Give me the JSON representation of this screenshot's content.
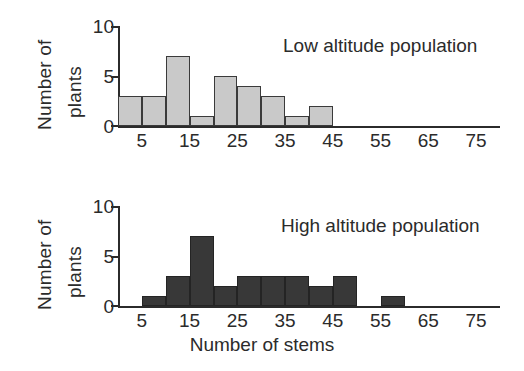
{
  "chart_data": [
    {
      "type": "bar",
      "title": "Low altitude population",
      "xlabel": "",
      "ylabel": "Number of plants",
      "ylabel_lines": [
        "Number of",
        "plants"
      ],
      "xlim": [
        0,
        80
      ],
      "ylim": [
        0,
        10
      ],
      "ytick_labels": [
        "10",
        "5",
        "0"
      ],
      "ytick_values": [
        10,
        5,
        0
      ],
      "xtick_labels": [
        "5",
        "15",
        "25",
        "35",
        "45",
        "55",
        "65",
        "75"
      ],
      "xtick_values": [
        5,
        15,
        25,
        35,
        45,
        55,
        65,
        75
      ],
      "bin_width": 10,
      "bin_starts": [
        0,
        10,
        20,
        30,
        40,
        50,
        60,
        70
      ],
      "grid": false,
      "legend": "none",
      "bar_fill": "#c9c9c9",
      "bar_edge": "#3a3a3a",
      "bars": [
        {
          "x_start": 0,
          "x_end": 5,
          "value": 3
        },
        {
          "x_start": 5,
          "x_end": 10,
          "value": 3
        },
        {
          "x_start": 10,
          "x_end": 15,
          "value": 7
        },
        {
          "x_start": 15,
          "x_end": 20,
          "value": 1
        },
        {
          "x_start": 20,
          "x_end": 25,
          "value": 5
        },
        {
          "x_start": 25,
          "x_end": 30,
          "value": 4
        },
        {
          "x_start": 30,
          "x_end": 35,
          "value": 3
        },
        {
          "x_start": 35,
          "x_end": 40,
          "value": 1
        },
        {
          "x_start": 40,
          "x_end": 45,
          "value": 2
        },
        {
          "x_start": 45,
          "x_end": 50,
          "value": 0
        },
        {
          "x_start": 50,
          "x_end": 55,
          "value": 0
        },
        {
          "x_start": 55,
          "x_end": 60,
          "value": 0
        },
        {
          "x_start": 60,
          "x_end": 65,
          "value": 0
        },
        {
          "x_start": 65,
          "x_end": 70,
          "value": 0
        },
        {
          "x_start": 70,
          "x_end": 75,
          "value": 0
        },
        {
          "x_start": 75,
          "x_end": 80,
          "value": 0
        }
      ],
      "categories": [
        2.5,
        7.5,
        12.5,
        17.5,
        22.5,
        27.5,
        32.5,
        37.5,
        42.5,
        47.5,
        52.5,
        57.5,
        62.5,
        67.5,
        72.5,
        77.5
      ],
      "values": [
        3,
        3,
        7,
        1,
        5,
        4,
        3,
        1,
        2,
        0,
        0,
        0,
        0,
        0,
        0,
        0
      ]
    },
    {
      "type": "bar",
      "title": "High altitude population",
      "xlabel": "Number of stems",
      "ylabel": "Number of plants",
      "ylabel_lines": [
        "Number of",
        "plants"
      ],
      "xlim": [
        0,
        80
      ],
      "ylim": [
        0,
        10
      ],
      "ytick_labels": [
        "10",
        "5",
        "0"
      ],
      "ytick_values": [
        10,
        5,
        0
      ],
      "xtick_labels": [
        "5",
        "15",
        "25",
        "35",
        "45",
        "55",
        "65",
        "75"
      ],
      "xtick_values": [
        5,
        15,
        25,
        35,
        45,
        55,
        65,
        75
      ],
      "bin_width": 10,
      "bin_starts": [
        0,
        10,
        20,
        30,
        40,
        50,
        60,
        70
      ],
      "grid": false,
      "legend": "none",
      "bar_fill": "#383838",
      "bar_edge": "#242424",
      "bars": [
        {
          "x_start": 0,
          "x_end": 5,
          "value": 0
        },
        {
          "x_start": 5,
          "x_end": 10,
          "value": 1
        },
        {
          "x_start": 10,
          "x_end": 15,
          "value": 3
        },
        {
          "x_start": 15,
          "x_end": 20,
          "value": 7
        },
        {
          "x_start": 20,
          "x_end": 25,
          "value": 2
        },
        {
          "x_start": 25,
          "x_end": 30,
          "value": 3
        },
        {
          "x_start": 30,
          "x_end": 35,
          "value": 3
        },
        {
          "x_start": 35,
          "x_end": 40,
          "value": 3
        },
        {
          "x_start": 40,
          "x_end": 45,
          "value": 2
        },
        {
          "x_start": 45,
          "x_end": 50,
          "value": 3
        },
        {
          "x_start": 50,
          "x_end": 55,
          "value": 0
        },
        {
          "x_start": 55,
          "x_end": 60,
          "value": 1
        },
        {
          "x_start": 60,
          "x_end": 65,
          "value": 0
        },
        {
          "x_start": 65,
          "x_end": 70,
          "value": 0
        },
        {
          "x_start": 70,
          "x_end": 75,
          "value": 0
        },
        {
          "x_start": 75,
          "x_end": 80,
          "value": 0
        }
      ],
      "categories": [
        2.5,
        7.5,
        12.5,
        17.5,
        22.5,
        27.5,
        32.5,
        37.5,
        42.5,
        47.5,
        52.5,
        57.5,
        62.5,
        67.5,
        72.5,
        77.5
      ],
      "values": [
        0,
        1,
        3,
        7,
        2,
        3,
        3,
        3,
        2,
        3,
        0,
        1,
        0,
        0,
        0,
        0
      ]
    }
  ],
  "figure": {
    "shared_xlabel": "Number of stems",
    "background": "#ffffff"
  }
}
